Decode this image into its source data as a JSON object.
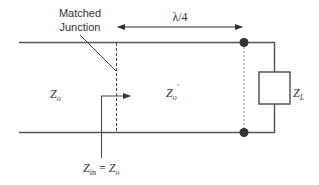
{
  "diagram": {
    "labels": {
      "junction_line1": "Matched",
      "junction_line2": "Junction",
      "length": "λ/4",
      "z0_left": "Z",
      "z0_left_sub": "o",
      "z0_prime": "Z",
      "z0_prime_sub": "o",
      "z0_prime_mark": "′",
      "zl": "Z",
      "zl_sub": "L",
      "zin_main": "Z",
      "zin_sub": "in",
      "zin_eq": " = ",
      "zin_rhs": "Z",
      "zin_rhs_sub": "o"
    },
    "colors": {
      "line": "#555555",
      "dot": "#333333",
      "text": "#333333"
    }
  }
}
